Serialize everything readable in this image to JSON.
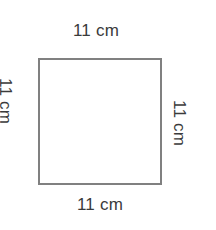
{
  "figure": {
    "type": "square",
    "shape_name": "square",
    "stroke_color": "#808080",
    "fill_color": "#ffffff",
    "text_color": "#3b3b3b",
    "background_color": "#ffffff",
    "labels": {
      "top": "11 cm",
      "right": "11 cm",
      "bottom": "11 cm",
      "left": "11 cm"
    }
  },
  "chart_data": {
    "type": "diagram",
    "title": "",
    "shape": "square",
    "side_length": 11,
    "units": "cm",
    "sides": [
      {
        "position": "top",
        "label": "11 cm",
        "value": 11,
        "unit": "cm",
        "orientation": "horizontal"
      },
      {
        "position": "left",
        "label": "11 cm",
        "value": 11,
        "unit": "cm",
        "orientation": "vertical"
      },
      {
        "position": "right",
        "label": "11 cm",
        "value": 11,
        "unit": "cm",
        "orientation": "vertical"
      },
      {
        "position": "bottom",
        "label": "11 cm",
        "value": 11,
        "unit": "cm",
        "orientation": "horizontal"
      }
    ]
  }
}
